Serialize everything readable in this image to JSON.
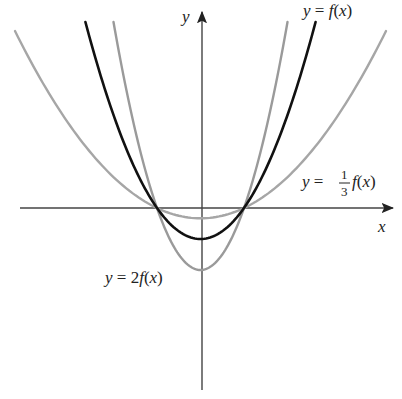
{
  "chart_data": {
    "type": "line",
    "title": "",
    "xlabel": "x",
    "ylabel": "y",
    "grid": false,
    "legend": "inline labels",
    "pixel_frame": {
      "origin_x": 201,
      "origin_y": 208,
      "axis_center_x": 200.5,
      "root_half_width": 43.5
    },
    "roots_shared": true,
    "series": [
      {
        "name": "y = f(x)",
        "label_parts": [
          "y = ",
          "f",
          "(",
          "x",
          ")"
        ],
        "color": "#111111",
        "width": 2.6,
        "scale": 1,
        "vertex_depth_px": 31,
        "top_y_px": 22
      },
      {
        "name": "y = 2f(x)",
        "color": "#9a9a9a",
        "width": 2.4,
        "scale": 2,
        "vertex_depth_px": 62,
        "top_y_px": 22
      },
      {
        "name": "y = (1/3) f(x)",
        "color": "#a6a6a6",
        "width": 2.4,
        "scale": 0.3333,
        "vertex_depth_px": 10.3,
        "top_y_px": 31
      }
    ],
    "axes": {
      "x_axis": {
        "from": [
          20,
          208
        ],
        "to": [
          395,
          208
        ],
        "label": "x"
      },
      "y_axis": {
        "from": [
          202,
          390
        ],
        "to": [
          202,
          10
        ],
        "label": "y"
      }
    }
  },
  "labels": {
    "f": {
      "y": "y",
      "eq": " = ",
      "fn": "f",
      "open": "(",
      "var": "x",
      "close": ")"
    },
    "two_f": {
      "y": "y",
      "eq": " = 2",
      "fn": "f",
      "open": "(",
      "var": "x",
      "close": ")"
    },
    "third_f": {
      "y": "y",
      "eq": " = ",
      "num": "1",
      "den": "3",
      "fn": "f",
      "open": "(",
      "var": "x",
      "close": ")"
    },
    "x_axis": "x",
    "y_axis": "y"
  }
}
